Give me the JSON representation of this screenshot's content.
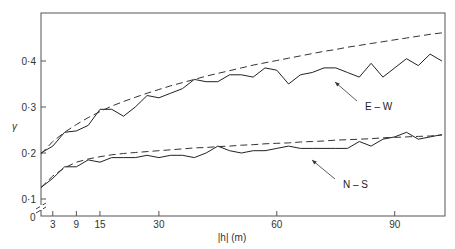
{
  "chart_data": {
    "type": "line",
    "title": "",
    "xlabel": "|h| (m)",
    "ylabel": "γ",
    "xlim": [
      0,
      103
    ],
    "ylim": [
      0.1,
      0.52
    ],
    "y_axis_break": true,
    "grid": false,
    "x_ticks": [
      3,
      9,
      15,
      30,
      60,
      90
    ],
    "x_tick_labels": [
      "3",
      "9",
      "15",
      "30",
      "60",
      "90"
    ],
    "y_ticks": [
      0.1,
      0.2,
      0.3,
      0.4
    ],
    "y_tick_labels": [
      "0·1",
      "0·2",
      "0·3",
      "0·4"
    ],
    "y_origin_label": "0",
    "x": [
      0,
      3,
      6,
      9,
      12,
      15,
      18,
      21,
      24,
      27,
      30,
      33,
      36,
      39,
      42,
      45,
      48,
      51,
      54,
      57,
      60,
      63,
      66,
      69,
      72,
      75,
      78,
      81,
      84,
      87,
      90,
      93,
      96,
      99,
      102
    ],
    "series": [
      {
        "name": "E-W",
        "style": "solid",
        "values": [
          0.2,
          0.215,
          0.245,
          0.248,
          0.26,
          0.295,
          0.295,
          0.28,
          0.3,
          0.325,
          0.32,
          0.33,
          0.34,
          0.36,
          0.355,
          0.355,
          0.37,
          0.37,
          0.365,
          0.385,
          0.38,
          0.35,
          0.37,
          0.375,
          0.385,
          0.385,
          0.375,
          0.365,
          0.395,
          0.365,
          0.385,
          0.405,
          0.39,
          0.415,
          0.4
        ]
      },
      {
        "name": "E-W model",
        "style": "dashed",
        "values": [
          0.198,
          0.225,
          0.245,
          0.262,
          0.277,
          0.29,
          0.302,
          0.312,
          0.321,
          0.33,
          0.338,
          0.346,
          0.353,
          0.36,
          0.367,
          0.373,
          0.379,
          0.385,
          0.391,
          0.396,
          0.401,
          0.406,
          0.411,
          0.416,
          0.421,
          0.425,
          0.43,
          0.434,
          0.438,
          0.442,
          0.446,
          0.45,
          0.454,
          0.458,
          0.461
        ]
      },
      {
        "name": "N-S",
        "style": "solid",
        "values": [
          0.125,
          0.145,
          0.17,
          0.17,
          0.185,
          0.18,
          0.19,
          0.19,
          0.19,
          0.195,
          0.19,
          0.195,
          0.195,
          0.19,
          0.2,
          0.215,
          0.205,
          0.2,
          0.205,
          0.205,
          0.21,
          0.215,
          0.21,
          0.21,
          0.21,
          0.21,
          0.21,
          0.225,
          0.215,
          0.23,
          0.235,
          0.245,
          0.23,
          0.235,
          0.24
        ]
      },
      {
        "name": "N-S model",
        "style": "dashed",
        "values": [
          0.125,
          0.15,
          0.168,
          0.18,
          0.187,
          0.192,
          0.196,
          0.199,
          0.201,
          0.203,
          0.205,
          0.207,
          0.209,
          0.211,
          0.212,
          0.214,
          0.215,
          0.217,
          0.218,
          0.22,
          0.221,
          0.222,
          0.224,
          0.225,
          0.226,
          0.228,
          0.229,
          0.23,
          0.231,
          0.233,
          0.234,
          0.235,
          0.236,
          0.237,
          0.239
        ]
      }
    ],
    "annotations": [
      {
        "text": "E – W",
        "points_to_series": "E-W",
        "at_x": 74
      },
      {
        "text": "N – S",
        "points_to_series": "N-S",
        "at_x": 62
      }
    ],
    "legend": "none (inline arrow labels)"
  }
}
